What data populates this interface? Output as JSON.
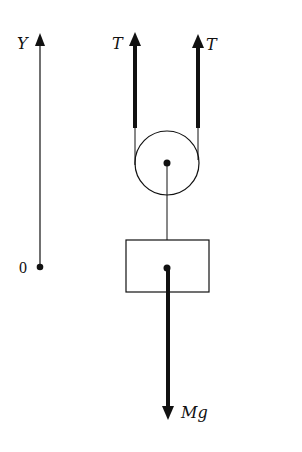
{
  "diagram": {
    "axis": {
      "label": "Y",
      "origin_label": "0"
    },
    "forces": [
      {
        "name": "tension-left",
        "label": "T",
        "direction": "up"
      },
      {
        "name": "tension-right",
        "label": "T",
        "direction": "up"
      },
      {
        "name": "weight",
        "label": "Mg",
        "direction": "down"
      }
    ],
    "colors": {
      "ink": "#111111",
      "background": "#ffffff"
    }
  }
}
